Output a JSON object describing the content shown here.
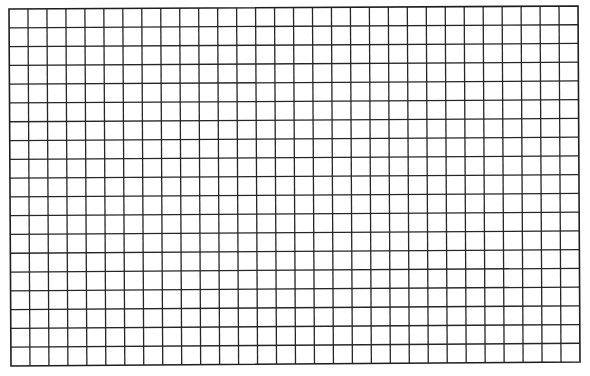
{
  "grid": {
    "columns": 30,
    "rows": 19,
    "line_color": "#262626",
    "background": "#ffffff"
  }
}
